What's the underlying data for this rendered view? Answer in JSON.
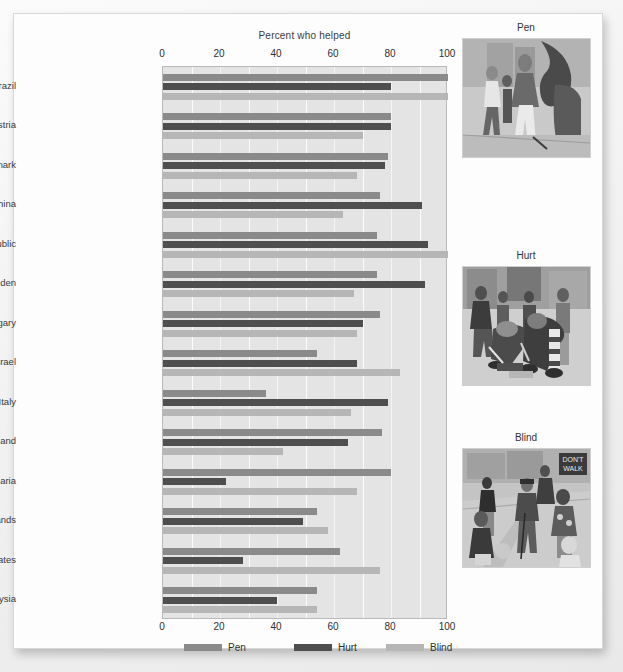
{
  "chart_data": {
    "type": "bar",
    "orientation": "horizontal",
    "title": "Percent who helped",
    "xlabel": "",
    "ylabel": "",
    "xlim": [
      0,
      100
    ],
    "xticks": [
      0,
      20,
      40,
      60,
      80,
      100
    ],
    "minor_tick_step": 10,
    "grid": true,
    "legend_position": "bottom",
    "categories": [
      "Rio de Janeiro, Brazil",
      "Vienna, Austria",
      "Copenhagen, Denmark",
      "Shanghai, China",
      "Prague, Czech Republic",
      "Stockholm, Sweden",
      "Budapest, Hungary",
      "Tel Aviv, Israel",
      "Rome, Italy",
      "Bangkok, Thailand",
      "Sofia, Bulgaria",
      "Amsterdam, Netherlands",
      "New York, United States",
      "Kuala Lumpur, Malaysia"
    ],
    "series": [
      {
        "name": "Pen",
        "color": "#8a8a8a",
        "values": [
          100,
          80,
          79,
          76,
          75,
          75,
          76,
          54,
          36,
          77,
          80,
          54,
          62,
          54
        ]
      },
      {
        "name": "Hurt",
        "color": "#4e4e4e",
        "values": [
          80,
          80,
          78,
          91,
          93,
          92,
          70,
          68,
          79,
          65,
          22,
          49,
          28,
          40
        ]
      },
      {
        "name": "Blind",
        "color": "#b6b6b6",
        "values": [
          100,
          70,
          68,
          63,
          100,
          67,
          68,
          83,
          66,
          42,
          68,
          58,
          76,
          54
        ]
      }
    ]
  },
  "axis": {
    "top_ticks": [
      "0",
      "20",
      "40",
      "60",
      "80",
      "100"
    ],
    "bottom_ticks": [
      "0",
      "20",
      "40",
      "60",
      "80",
      "100"
    ]
  },
  "legend": {
    "items": [
      {
        "label": "Pen",
        "key": "pen"
      },
      {
        "label": "Hurt",
        "key": "hurt"
      },
      {
        "label": "Blind",
        "key": "blind"
      }
    ]
  },
  "panels": [
    {
      "title": "Pen",
      "icon": "sketch-pen-dropped-illustration"
    },
    {
      "title": "Hurt",
      "icon": "sketch-hurt-leg-illustration"
    },
    {
      "title": "Blind",
      "icon": "sketch-blind-man-crossing-illustration"
    }
  ]
}
